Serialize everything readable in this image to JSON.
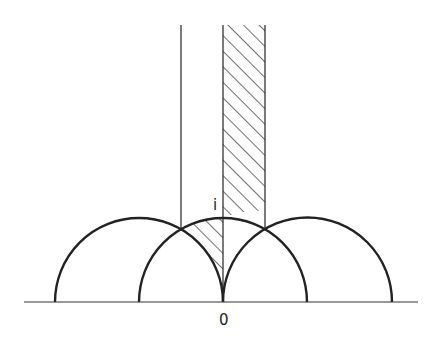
{
  "diagram": {
    "labels": {
      "i": "i",
      "origin": "0"
    },
    "colors": {
      "stroke": "#222222",
      "background": "#ffffff"
    },
    "axis": {
      "y": 302,
      "x_start": 24,
      "x_end": 418
    },
    "semicircles": [
      {
        "cx": 139,
        "r": 84
      },
      {
        "cx": 223,
        "r": 84
      },
      {
        "cx": 308,
        "r": 84
      }
    ],
    "vertical_lines": [
      {
        "x": 181,
        "y_top": 25
      },
      {
        "x": 223,
        "y_top": 25
      },
      {
        "x": 265,
        "y_top": 25
      }
    ]
  }
}
